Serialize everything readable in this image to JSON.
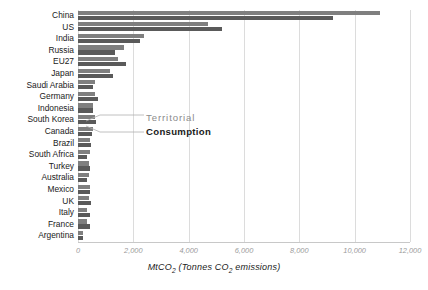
{
  "chart_data": {
    "type": "bar",
    "orientation": "horizontal",
    "title": "",
    "subtitle": "",
    "xlabel": "MtCO2 (Tonnes CO2 emissions)",
    "xlabel_parts": {
      "prefix": "MtCO",
      "sub1": "2",
      "mid": " (Tonnes CO",
      "sub2": "2",
      "suffix": " emissions)"
    },
    "ylabel": "",
    "xlim": [
      0,
      12000
    ],
    "ylim": null,
    "grid": "vertical",
    "legend_position": "inline-annotation",
    "xticks": [
      0,
      2000,
      4000,
      6000,
      8000,
      10000,
      12000
    ],
    "xtick_labels": [
      "0",
      "2,000",
      "4,000",
      "6,000",
      "8,000",
      "10,000",
      "12,000"
    ],
    "categories": [
      "China",
      "US",
      "India",
      "Russia",
      "EU27",
      "Japan",
      "Saudi Arabia",
      "Germany",
      "Indonesia",
      "South Korea",
      "Canada",
      "Brazil",
      "South Africa",
      "Turkey",
      "Australia",
      "Mexico",
      "UK",
      "Italy",
      "France",
      "Argentina"
    ],
    "series": [
      {
        "name": "Territorial",
        "color": "#7f7f7f",
        "values": [
          10900,
          4700,
          2400,
          1650,
          1450,
          1150,
          620,
          620,
          560,
          600,
          540,
          440,
          430,
          400,
          390,
          440,
          380,
          340,
          330,
          190
        ]
      },
      {
        "name": "Consumption",
        "color": "#5a5a5a",
        "values": [
          9200,
          5200,
          2250,
          1350,
          1750,
          1250,
          540,
          740,
          530,
          640,
          490,
          460,
          340,
          420,
          330,
          420,
          480,
          420,
          430,
          180
        ]
      }
    ],
    "annotations": [
      {
        "text": "Territorial",
        "series": "Territorial",
        "style": "gray"
      },
      {
        "text": "Consumption",
        "series": "Consumption",
        "style": "bold-dark"
      }
    ]
  },
  "colors": {
    "territorial": "#7f7f7f",
    "consumption": "#5a5a5a",
    "gridline": "#dcdcdc",
    "axis": "#c8c8c8",
    "tick_text": "#9a9a9a",
    "label_text": "#1a1a1a",
    "background": "#ffffff"
  }
}
